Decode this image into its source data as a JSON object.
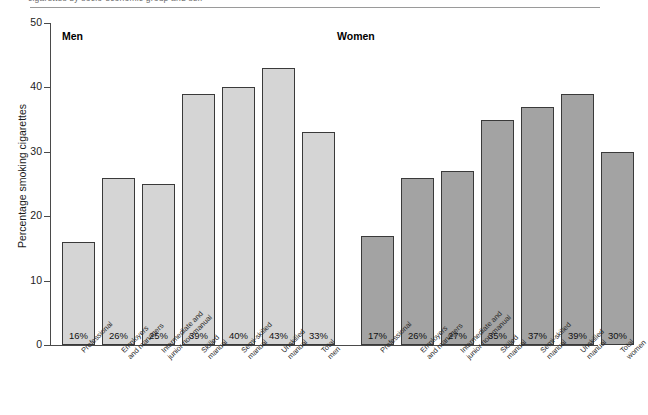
{
  "figure": {
    "clipped_top_text": "cigarettes by socio-economic group and sex",
    "men_group_title": "Men",
    "women_group_title": "Women"
  },
  "chart_data": {
    "type": "bar",
    "title": "",
    "xlabel": "",
    "ylabel": "Percentage smoking cigarettes",
    "ylim": [
      0,
      50
    ],
    "yticks": [
      0,
      10,
      20,
      30,
      40,
      50
    ],
    "ytick_labels": [
      "0",
      "10",
      "20",
      "30",
      "40",
      "50"
    ],
    "grid": false,
    "legend": "none",
    "group_labels": [
      "Men",
      "Women"
    ],
    "categories": [
      "Professional",
      "Employers\nand managers",
      "Intermediate and\njunior non-manual",
      "Skilled\nmanual",
      "Semi-skilled\nmanual",
      "Unskilled\nmanual",
      "Total\nmen"
    ],
    "categories_women": [
      "Professional",
      "Employers\nand managers",
      "Intermediate and\njunior non-manual",
      "Skilled\nmanual",
      "Semi-skilled\nmanual",
      "Unskilled\nmanual",
      "Total\nwomen"
    ],
    "series": [
      {
        "name": "Men",
        "color": "#d5d5d5",
        "values": [
          16,
          26,
          25,
          39,
          40,
          43,
          33
        ],
        "data_labels": [
          "16%",
          "26%",
          "25%",
          "39%",
          "40%",
          "43%",
          "33%"
        ]
      },
      {
        "name": "Women",
        "color": "#a3a3a3",
        "values": [
          17,
          26,
          27,
          35,
          37,
          39,
          30
        ],
        "data_labels": [
          "17%",
          "26%",
          "27%",
          "35%",
          "37%",
          "39%",
          "30%"
        ]
      }
    ]
  }
}
